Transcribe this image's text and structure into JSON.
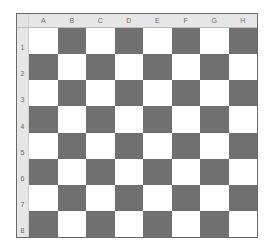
{
  "board": {
    "columns": [
      "A",
      "B",
      "C",
      "D",
      "E",
      "F",
      "G",
      "H"
    ],
    "rows": [
      "1",
      "2",
      "3",
      "4",
      "5",
      "6",
      "7",
      "8"
    ],
    "colors": {
      "light": "#ffffff",
      "dark": "#707070",
      "header": "#e6e6e6"
    },
    "first_square": "light"
  }
}
